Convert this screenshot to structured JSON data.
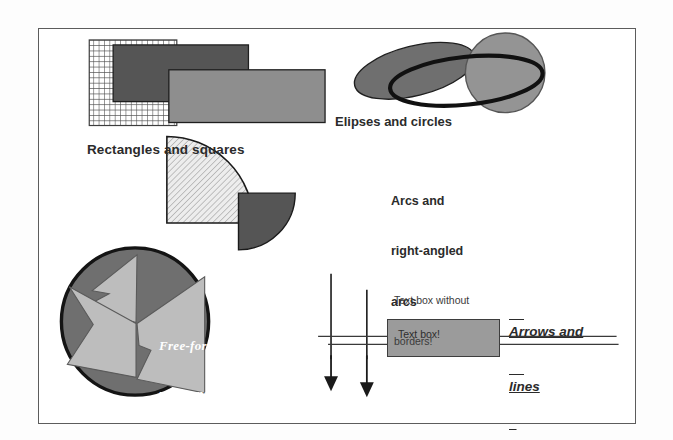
{
  "document": {
    "title": "Drawing objects sample slide",
    "background_color": "#ffffff",
    "frame_border_color": "#5c5c5c"
  },
  "labels": {
    "rectangles": "Rectangles and squares",
    "ellipses": "Elipses and circles",
    "arcs_line1": "Arcs and",
    "arcs_line2": "right-angled",
    "arcs_line3": "arcs",
    "arrows_line1": "Arrows and",
    "arrows_line2": "lines",
    "textbox_note_line1": "Text box without",
    "textbox_note_line2": "borders!",
    "textbox_inner": "Text box!",
    "polygons_line1": "Free-form",
    "polygons_line2": "polygons"
  },
  "shapes": {
    "grid_square": {
      "name": "grid-patterned-square",
      "fill": "#ffffff",
      "pattern": "grid",
      "pattern_color": "#4a4a4a",
      "border": "#3d3d3d"
    },
    "dark_rectangle": {
      "name": "dark-gray-rectangle",
      "fill": "#555555",
      "border": "#222222"
    },
    "light_rectangle": {
      "name": "medium-gray-rectangle",
      "fill": "#8e8e8e",
      "border": "#222222"
    },
    "tilted_ellipse": {
      "name": "tilted-filled-ellipse",
      "fill": "#6f6f6f",
      "border": "#1f1f1f",
      "rotation_deg": -14
    },
    "circle": {
      "name": "gray-circle",
      "fill": "#949494",
      "border": "#4a4a4a"
    },
    "outline_ellipse": {
      "name": "thick-outline-ellipse",
      "fill": "none",
      "border": "#111111",
      "border_width_px": 4,
      "rotation_deg": -8
    },
    "hatched_arc": {
      "name": "hatched-quarter-arc",
      "fill": "#e3e3e3",
      "pattern": "diagonal-hatch",
      "pattern_color": "#b4b4b4",
      "border": "#1a1a1a"
    },
    "dark_arc": {
      "name": "dark-quarter-arc",
      "fill": "#555555",
      "border": "#1a1a1a"
    },
    "polygon_circle": {
      "name": "free-form-polygon-circle",
      "fill": "#6f6f6f",
      "border": "#141414"
    },
    "polygon_blades": {
      "name": "pinwheel-polygons",
      "fill": "#bdbdbd",
      "border": "#4a4a4a",
      "count": 3
    },
    "text_box": {
      "name": "gray-text-box",
      "fill": "#9b9b9b",
      "border": "#3d3d3d"
    },
    "arrows": {
      "name": "down-arrows",
      "color": "#1a1a1a",
      "count": 2
    },
    "horizontal_lines": {
      "name": "horizontal-lines",
      "color": "#3a3a3a",
      "count": 2
    },
    "leader_line": {
      "name": "callout-leader-line",
      "color": "#1a1a1a"
    }
  }
}
